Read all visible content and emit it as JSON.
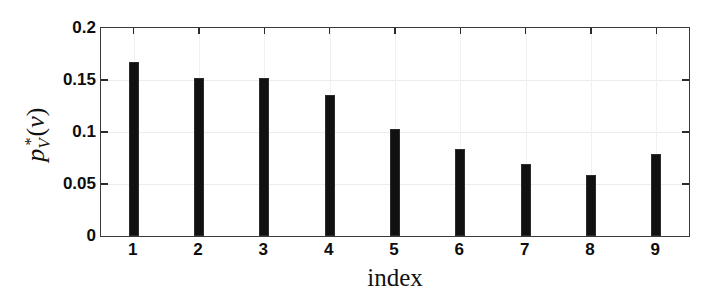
{
  "chart_data": {
    "type": "bar",
    "title": "",
    "subtitle": "",
    "xlabel": "index",
    "ylabel": "p*_V(v)",
    "ylabel_parts": {
      "base": "p",
      "subscript": "V",
      "superscript": "*",
      "argument": "(v)"
    },
    "categories": [
      "1",
      "2",
      "3",
      "4",
      "5",
      "6",
      "7",
      "8",
      "9"
    ],
    "values": [
      0.167,
      0.152,
      0.152,
      0.136,
      0.103,
      0.084,
      0.069,
      0.059,
      0.079
    ],
    "xlim": [
      0.5,
      9.5
    ],
    "ylim": [
      0,
      0.2
    ],
    "ytick_values": [
      0,
      0.05,
      0.1,
      0.15,
      0.2
    ],
    "ytick_labels": [
      "0",
      "0.05",
      "0.1",
      "0.15",
      "0.2"
    ],
    "xtick_labels": [
      "1",
      "2",
      "3",
      "4",
      "5",
      "6",
      "7",
      "8",
      "9"
    ],
    "grid": true,
    "legend": null,
    "bar_color": "#111111",
    "axis_color": "#3a3a3a",
    "grid_color": "#ececec",
    "background": "#ffffff",
    "bar_width_fraction": 0.155
  }
}
